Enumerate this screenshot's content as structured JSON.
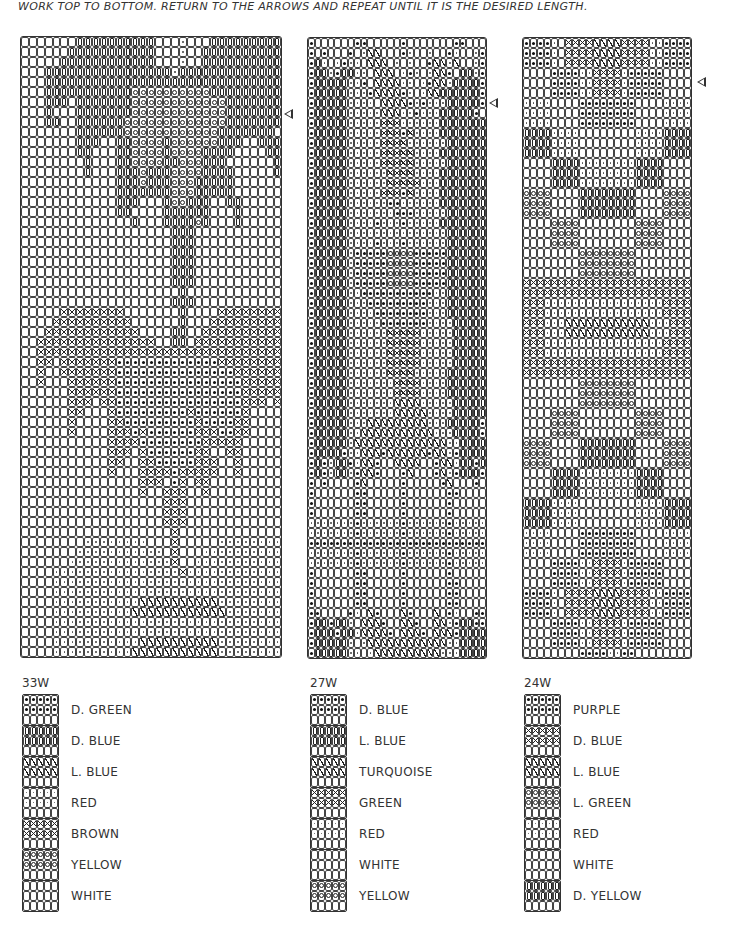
{
  "header": {
    "instructions": "Work top to bottom. Return to the arrows and repeat until it is the desired length."
  },
  "charts": [
    {
      "id": "33W",
      "left": 20,
      "top": 36,
      "cols": 33,
      "rows": 62,
      "cellW": 7.9,
      "cellH": 10,
      "arrow": {
        "left": 284,
        "top": 109
      },
      "pattern": [
        ".......iiiiiiiiii...s...iiiiiiiiii.....",
        "......iiiiiiiiiii...s..iiiiiiiiiiii....",
        ".....iiiiiiiiiiii...s..iiiiiiiiiiiii...",
        "...iiiiiiiiiiiiiiiisiiiiiiiiiiiiiiiii..",
        "...iiiiiiiiiiiiiiiiiiiiiiiiiiiiiiiiii..",
        "...iiiiiiiiiiiooooooooooiiiiiiiiiiiii..",
        "...iii.iiiiiiiooooooooooooiiiiiiii.ii..",
        "...i...iiiiiiiooooooooooooiiiiiii...i..",
        "...ii..iiiiiioooooooooooooiiiiiii...i..",
        ".......iiiiiiooooooooooooiiiiiii.......",
        ".......iii..iiooooiooooooiii..iii......",
        ".......ii...iiooooiooooiiii....ii......",
        "........i...iiooooiioooiii......i......",
        "........i...iiioiiiooooiiii.....i......",
        "............iiioiiioooiiiii............",
        "............iiiiiiioooiiiii............",
        "............iii...iooiii..ii...........",
        "............ii....iiiiii...i...........",
        "..............i...iiiioi...i...........",
        "...................iii.................",
        "...................iii.................",
        "...................iii.................",
        "...................iii.................",
        "...................iii.................",
        "...................iii.................",
        "....................i..................",
        "...................iii.................",
        ".....xxxxxxxx.......i....xxxxxxxxx.....",
        "....xxxxxxxxxx......i...xxxxxxxxxxx....",
        "...xxxxxxxxxxxx....ii..xxxxxxxxxxxxx...",
        "..xxxxxxxxxxxxxxx..ii.xxxxxxxxxxxxxxx..",
        "..xxxxxxxxxxxxxxxxxxxxxxxxxxxxxxxxxxx..",
        "..xx.xxxxxxxdddddddddddddxxxxxxxxxxxx..",
        "..x..xxxxxxxdddddddddddddddxxxxxxx.xx..",
        "..x...xxxxxxddddddddddddddddxxxxx...x..",
        "......xxxxxxddddddddddddddddxxxxx......",
        "......xxx.xxddddddddddddddddxxx.xx.....",
        "......xx...xdddddddddxddddddx....x.....",
        "......x....xxdddddddddxddddxx....x.....",
        "......x....xxxdxddddddxxxddxx....x.....",
        "...........xxxxddddddddxxxxx...........",
        "...........xxx.xddddddxx..xx...........",
        "...........xx..xxdddddxxx..x...........",
        "...........x...xxxxdxxxxx..x...........",
        "...............xxx.dx.xx...............",
        "...............x..xxx..x...............",
        "..................xxx..................",
        "..................xxx..................",
        "..................xxx..................",
        "...................x...................",
        "........ssssssss...x.....ssssssss......",
        ".......sssssssssss.x...sssssssssss.....",
        "......sssssssssssssx..sssssssssssss....",
        "....ssssssssssssssssxsssssssssssssssss..",
        "....ssssssssssssssssssssssssssssssssss..",
        "....ssssssssssssssssssssssssssssssssss..",
        "....sssssssssssbbbbbbbbbbsssssssssssss..",
        "....ssssssssssbbbbbbbbbbbbssssssssssss..",
        "....ssssssssssssssssssssssssssssssssss..",
        "....ssssssssssssssssssssssssssssssssss..",
        "....sssssssssssbbbbbbbbbbsssssssssssss..",
        "....ssssssssssbbbbbbbbbbbsssssssssssss.."
      ]
    },
    {
      "id": "27W",
      "left": 307,
      "top": 37,
      "cols": 27,
      "rows": 62,
      "cellW": 6.6,
      "cellH": 10,
      "arrow": {
        "left": 489,
        "top": 98
      },
      "pattern": [
        "d......dd.....d.......dd...d",
        "d.d...d.sb\\...ds..s..ds..sd",
        "dis.sdss.b\\\\.s.s..dbbsb..sd",
        "diisdiiss.\\\\\\.sds.s\\\\d.iisd",
        "diiiiissd.\\\\\\\\ss.sd\\\\siiiid",
        "diiiiisssd\\\\\\\\ds.s\\\\iiiiiid",
        "diiiiissss.\\\\\\\\dsdsssiiiiid",
        "diiiiisssss\\\\\\ssdsssiiiiid",
        "diiiiisssssxxxssssssiiiiiiid",
        "diiiiisssssxxxdxssssiiiiiiid",
        "diiiiisssssxxxxssssssiiiiiid",
        "diiiiisssssxxxxxssssiiiiiiid",
        "diiiiisssssxxxxxsssssiiiiiid",
        "diiiiissssssxxxxssssiiiiiiid",
        "diiiiissssssxxxxxsssiiiiiiid",
        "diiiiisssssxxxdxssssiiiiiiid",
        "diiiiissssssddssssssiiiiiiid",
        "diiiiisssssssdddsssssiiiiiid",
        "diiiiissssdsssdsssssiiiiiiid",
        "diiiiisssssssssssssssiiiiiid",
        "diiiiissssdsssdssssssiiiiiid",
        "diiiiisdddddoooodddddiiiiiid",
        "diiiiisdddddoooodddddiiiiiid",
        "diiiiisdddddoooodddddiiiiiid",
        "diiiiisdddddoooodddddiiiiiid",
        "diiiiissdddddddddddssiiiiiid",
        "diiiiisssdddddddddsssiiiiiid",
        "diiiiissssddddddddsssiiiiiid",
        "diiiiisssssdddddddssssiiiiid",
        "diiiiissssssxxxxxsssssiiiiid",
        "diiiiissssssxxxxxsssssiiiiid",
        "diiiiissssssxxxxxsssssiiiiid",
        "diiiiissssssxxxxxsssssiiiiid",
        "diiiiissssssxxxxsssssiiiiiid",
        "diiiiisssssssxxxxssssiiiiiid",
        "diiiiisssssssxxxxssssiiiiiid",
        "diiiiisssssss\\\\\\\\sssssiiiiid",
        "diiiiisssssss\\\\\\\\\\ssssiiiiid",
        "diiiiisss\\\\\\\\\\\\\\\\\\sssiiiiid",
        "diiiiiss\\\\\\\\\\\\\\\\\\\\\\sssiiiid",
        "diiiiis\\\\\\\\\\\\\\\\\\\\\\\\\\\\ssiiiid",
        "diiiidss\\\\\\d\\\\\\\\\\\\d\\\\sdiiiid",
        "didsiids\\\\d..\\\\\\\\..d\\\\siidid",
        "didsiisd\\\\d...d\\...d\\sdiiid",
        "d.d....d\\.....d.....d\\...d.d",
        "d......dd.....d......dd....d",
        "d......dd.....d......d.....d",
        "d......dd.....d......d.....d",
        "sssssssdssssssdssssssdssssss",
        "sssssssdssssssdssssssdssssss",
        "ddddddddddddddddddddddddddd",
        "sssssssdssssssdssssssdssssss",
        "sssssssdssssssdssssssdssssss",
        "d......dd.....d......d.....d",
        "d......dd.....d......dd....d",
        "d......dd.....d......dd....d",
        "d......dd.....d......dd....d",
        "dd....ds.\\d...\\d...\\.ds..dd",
        "diidiis.\\\\\\d..\\\\d..\\\\sdiidd",
        "diiidiis\\\\\\\\d.\\\\\\d.\\\\\\diiiid",
        "diiiiis.s\\\\\\\\\\\\\\\\\\\\\\\\ssiiiid",
        "diiiiiss.s\\\\\\\\\\\\\\\\\\\\sssiiiid"
      ]
    },
    {
      "id": "24W",
      "left": 522,
      "top": 37,
      "cols": 24,
      "rows": 62,
      "cellW": 7,
      "cellH": 10,
      "arrow": {
        "left": 697,
        "top": 77
      },
      "pattern": [
        "dddds.xxxx\\\\\\\\xxxxssdddd",
        "dddds.xxxx\\\\\\\\xxxxssdddd",
        "dddds.xxxx\\\\\\\\xxxxssdddd",
        "....ddddssxxxxsddddd....",
        "....ddddssxxxxsddddd....",
        "....ddddssxxxxsddddd....",
        "ssss....dddddddd....ssss",
        "ssss....dddddddd....ssss",
        "ssss....dddddddd....ssss",
        "iiiissss........ssssiiii",
        "iiiissss........ssssiiii",
        "iiiissss........ssssiiii",
        "....iiiissssssssiiii....",
        "....iiiissssssssiiii....",
        "....iiiissssssssiiii....",
        "oooo....iiiiiiii....oooo",
        "oooo....iiiiiiii....oooo",
        "oooo....iiiiiiii....oooo",
        "....oooo........oooo....",
        "....oooo........oooo....",
        "....oooo........oooo....",
        "........oooooooo........",
        "........oooooooo........",
        "........oooooooo........",
        "xxxxxxxxxxxxxxxxxxxxxxxx",
        "xxxxxxxxxxxxxxxxxxxxxxxx",
        "xxxsssssssssssssssssxxxx",
        "xxxsssssssssssssssssxxxx",
        "xxxsss\\\\\\\\\\\\\\\\\\\\\\\\sssxxxx",
        "xxxsss\\\\\\\\\\\\\\\\\\\\\\\\sssxxxx",
        "xxxsssssssssssssssssxxxx",
        "xxxsssssssssssssssssxxxx",
        "xxxxxxxxxxxxxxxxxxxxxxxx",
        "xxxxxxxxxxxxxxxxxxxxxxxx",
        "........oooooooo........",
        "........oooooooo........",
        "........oooooooo........",
        "....oooo........oooo....",
        "....oooo........oooo....",
        "....oooo........oooo....",
        "oooo....iiiiiiii....oooo",
        "oooo....iiiiiiii....oooo",
        "oooo....iiiiiiii....oooo",
        "....iiiissssssssiiii....",
        "....iiiissssssssiiii....",
        "....iiiissssssssiiii....",
        "iiiissss........ssssiiii",
        "iiiissss........ssssiiii",
        "iiiissss........ssssiiii",
        "ssss....dddddddd....ssss",
        "ssss....dddddddd....ssss",
        "ssss....dddddddd....ssss",
        "....ddddssxxxxsddddd....",
        "....ddddssxxxxsddddd....",
        "....ddddssxxxxsddddd....",
        "dddds.xxxx\\\\\\\\xxxxssdddd",
        "dddds.xxxx\\\\\\\\xxxxssdddd",
        "dddds.xxxx\\\\\\\\xxxxssdddd",
        "....ddddssxxxxsddddd....",
        "....ddddssxxxxsddddd....",
        "....ddddssxxxxsddddd....",
        "........ddddssdd........"
      ]
    }
  ],
  "legends": [
    {
      "title": "33W",
      "left": 22,
      "top": 676,
      "items": [
        {
          "symbol": "d",
          "label": "D. GREEN"
        },
        {
          "symbol": "i",
          "label": "D. BLUE"
        },
        {
          "symbol": "b",
          "label": "L. BLUE"
        },
        {
          "symbol": "s",
          "label": "RED"
        },
        {
          "symbol": "x",
          "label": "BROWN"
        },
        {
          "symbol": "o",
          "label": "YELLOW"
        },
        {
          "symbol": ".",
          "label": "WHITE"
        }
      ]
    },
    {
      "title": "27W",
      "left": 310,
      "top": 676,
      "items": [
        {
          "symbol": "d",
          "label": "D. BLUE"
        },
        {
          "symbol": "i",
          "label": "L. BLUE"
        },
        {
          "symbol": "b",
          "label": "TURQUOISE"
        },
        {
          "symbol": "x",
          "label": "GREEN"
        },
        {
          "symbol": "s",
          "label": "RED"
        },
        {
          "symbol": ".",
          "label": "WHITE"
        },
        {
          "symbol": "o",
          "label": "YELLOW"
        }
      ]
    },
    {
      "title": "24W",
      "left": 524,
      "top": 676,
      "items": [
        {
          "symbol": "d",
          "label": "PURPLE"
        },
        {
          "symbol": "x",
          "label": "D. BLUE"
        },
        {
          "symbol": "b",
          "label": "L. BLUE"
        },
        {
          "symbol": "o",
          "label": "L. GREEN"
        },
        {
          "symbol": "s",
          "label": "RED"
        },
        {
          "symbol": ".",
          "label": "WHITE"
        },
        {
          "symbol": "i",
          "label": "D. YELLOW"
        }
      ]
    }
  ]
}
